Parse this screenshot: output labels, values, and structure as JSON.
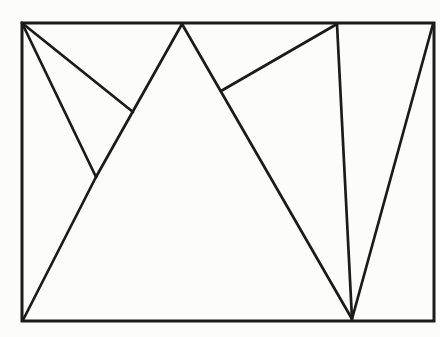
{
  "figure": {
    "canvas": {
      "width": 440,
      "height": 337,
      "background_color": "#fcfcfa"
    },
    "stroke": {
      "color": "#1b1b1b",
      "frame_width": 3,
      "line_width": 2.7
    },
    "frame": {
      "x": 22,
      "y": 23,
      "width": 412,
      "height": 298
    },
    "vertices": {
      "top_left_corner": [
        22,
        23
      ],
      "bottom_left_corner": [
        23,
        320
      ],
      "top_right_corner": [
        433,
        24
      ],
      "bottom_right_corner": [
        434,
        321
      ],
      "top_peak_left": [
        182,
        24
      ],
      "interior_valley": [
        96,
        177
      ],
      "left_flank_junction": [
        133,
        112
      ],
      "top_peak_right": [
        337,
        24
      ],
      "right_flank_junction": [
        221,
        91
      ],
      "bottom_convergence_point": [
        352,
        319
      ]
    },
    "segments": [
      {
        "name": "top-left-corner-to-left-flank-junction",
        "from": [
          22,
          23
        ],
        "to": [
          133,
          112
        ]
      },
      {
        "name": "top-left-corner-to-valley",
        "from": [
          22,
          23
        ],
        "to": [
          96,
          177
        ]
      },
      {
        "name": "left-peak-left-flank",
        "from": [
          182,
          24
        ],
        "to": [
          96,
          177
        ]
      },
      {
        "name": "valley-to-bottom-left-corner",
        "from": [
          96,
          177
        ],
        "to": [
          23,
          320
        ]
      },
      {
        "name": "left-peak-right-flank",
        "from": [
          182,
          24
        ],
        "to": [
          352,
          319
        ]
      },
      {
        "name": "right-peak-to-flank-junction",
        "from": [
          337,
          24
        ],
        "to": [
          221,
          91
        ]
      },
      {
        "name": "right-peak-to-bottom-convergence",
        "from": [
          337,
          24
        ],
        "to": [
          352,
          319
        ]
      },
      {
        "name": "top-right-corner-to-bottom-convergence",
        "from": [
          433,
          24
        ],
        "to": [
          352,
          319
        ]
      }
    ]
  }
}
